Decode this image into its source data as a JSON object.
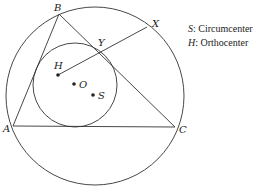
{
  "diagram": {
    "type": "geometry",
    "colors": {
      "stroke": "#333333",
      "background": "#ffffff",
      "text": "#222222"
    },
    "points": {
      "A": {
        "label": "A",
        "x": 13,
        "y": 126
      },
      "B": {
        "label": "B",
        "x": 59,
        "y": 14
      },
      "C": {
        "label": "C",
        "x": 175,
        "y": 127
      },
      "X": {
        "label": "X",
        "x": 147,
        "y": 27
      },
      "Y": {
        "label": "Y",
        "x": 100,
        "y": 52
      },
      "H": {
        "label": "H",
        "x": 58,
        "y": 75
      },
      "O": {
        "label": "O",
        "x": 74,
        "y": 84
      },
      "S": {
        "label": "S",
        "x": 93,
        "y": 95
      }
    },
    "circles": {
      "outer": {
        "cx": 95,
        "cy": 96,
        "r": 89
      },
      "inner": {
        "cx": 75,
        "cy": 85,
        "r": 42
      }
    },
    "segments": [
      [
        "A",
        "B"
      ],
      [
        "B",
        "C"
      ],
      [
        "A",
        "C"
      ],
      [
        "H",
        "X"
      ]
    ]
  },
  "legend": {
    "items": [
      {
        "symbol": "S",
        "text": ":  Circumcenter"
      },
      {
        "symbol": "H",
        "text": ": Orthocenter"
      }
    ]
  }
}
